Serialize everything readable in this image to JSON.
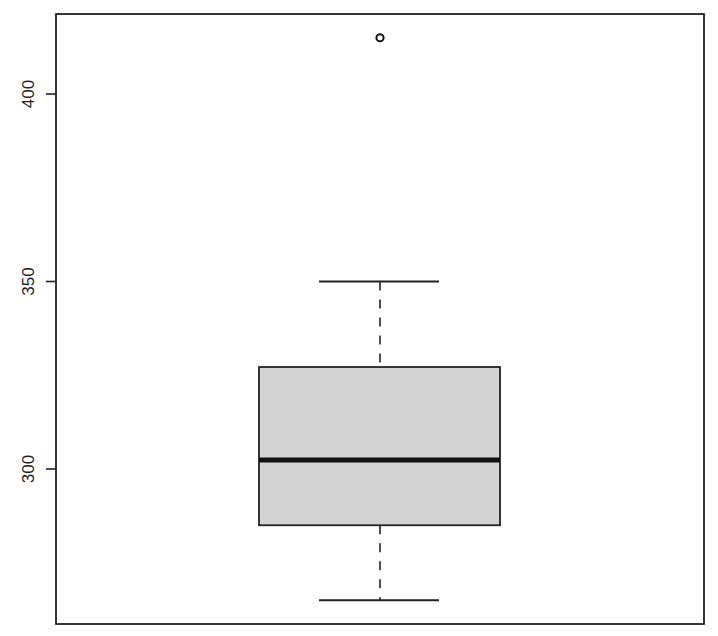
{
  "chart_data": {
    "type": "boxplot",
    "title": "",
    "xlabel": "",
    "ylabel": "",
    "ylim": [
      261.5,
      420
    ],
    "yticks": [
      300,
      350,
      400
    ],
    "ytick_labels": [
      "300",
      "350",
      "400"
    ],
    "grid": false,
    "legend": null,
    "series": [
      {
        "name": "",
        "whisker_low": 265,
        "q1": 285,
        "median": 302.4,
        "q3": 327.2,
        "whisker_high": 350,
        "outliers": [
          415
        ],
        "fill_color": "#d3d3d3",
        "line_color": "#000000"
      }
    ]
  },
  "axis": {
    "ticks": [
      {
        "label": "400",
        "value": 400
      },
      {
        "label": "350",
        "value": 350
      },
      {
        "label": "300",
        "value": 300
      }
    ]
  }
}
